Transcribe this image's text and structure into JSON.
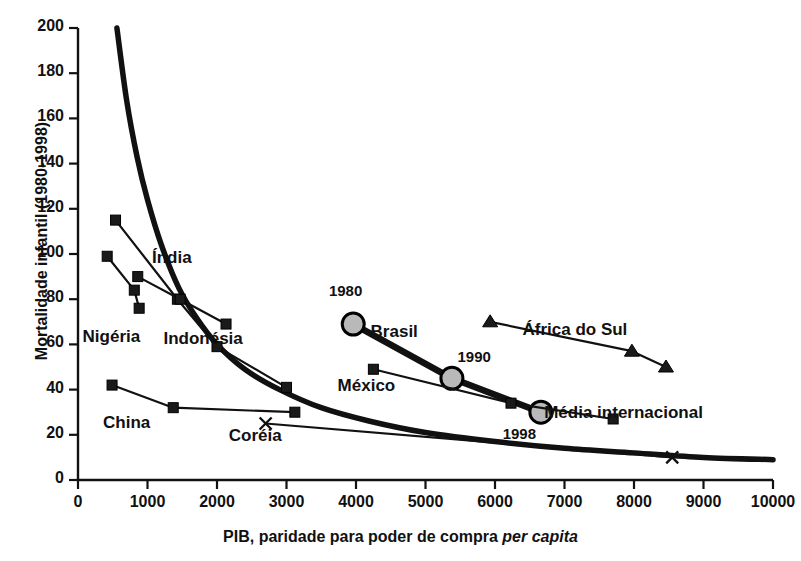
{
  "chart_data": {
    "type": "line",
    "title": "",
    "xlabel": "PIB, paridade para poder de compra per capita",
    "xlabel_plain": "PIB, paridade para poder de compra ",
    "xlabel_italic": "per capita",
    "ylabel": "Mortalidade infantil (1980-1998)",
    "xlim": [
      0,
      10000
    ],
    "ylim": [
      0,
      200
    ],
    "xticks": [
      0,
      1000,
      2000,
      3000,
      4000,
      5000,
      6000,
      7000,
      8000,
      9000,
      10000
    ],
    "yticks": [
      0,
      20,
      40,
      60,
      80,
      100,
      120,
      140,
      160,
      180,
      200
    ],
    "xtick_labels": [
      "0",
      "1000",
      "2000",
      "3000",
      "4000",
      "5000",
      "6000",
      "7000",
      "8000",
      "9000",
      "10000"
    ],
    "ytick_labels": [
      "0",
      "20",
      "40",
      "60",
      "80",
      "100",
      "120",
      "140",
      "160",
      "180",
      "200"
    ],
    "grid": false,
    "legend": "inline-annotations",
    "annotations": [
      {
        "id": "ann-1980",
        "text": "1980",
        "x": 3850,
        "y": 83
      },
      {
        "id": "ann-1990",
        "text": "1990",
        "x": 5700,
        "y": 54
      },
      {
        "id": "ann-1998",
        "text": "1998",
        "x": 6350,
        "y": 20
      }
    ],
    "series": [
      {
        "name": "Média internacional",
        "marker": "none",
        "style": "thick-fitted-curve",
        "label_x": 7850,
        "label_y": 29,
        "points": [
          {
            "x": 560,
            "y": 200
          },
          {
            "x": 700,
            "y": 168
          },
          {
            "x": 850,
            "y": 143
          },
          {
            "x": 1000,
            "y": 124
          },
          {
            "x": 1200,
            "y": 104
          },
          {
            "x": 1450,
            "y": 85
          },
          {
            "x": 1700,
            "y": 72
          },
          {
            "x": 2000,
            "y": 60
          },
          {
            "x": 2400,
            "y": 49
          },
          {
            "x": 2900,
            "y": 40
          },
          {
            "x": 3500,
            "y": 32
          },
          {
            "x": 4200,
            "y": 26
          },
          {
            "x": 5000,
            "y": 21
          },
          {
            "x": 6000,
            "y": 17
          },
          {
            "x": 7000,
            "y": 14
          },
          {
            "x": 8000,
            "y": 12
          },
          {
            "x": 9000,
            "y": 10
          },
          {
            "x": 10000,
            "y": 9
          }
        ]
      },
      {
        "name": "Índia",
        "marker": "square",
        "style": "thin",
        "label_x": 1350,
        "label_y": 98,
        "points": [
          {
            "x": 540,
            "y": 115
          },
          {
            "x": 1430,
            "y": 80
          },
          {
            "x": 2000,
            "y": 59
          },
          {
            "x": 3000,
            "y": 41
          }
        ]
      },
      {
        "name": "Nigéria",
        "marker": "square",
        "style": "thin",
        "label_x": 480,
        "label_y": 63,
        "points": [
          {
            "x": 420,
            "y": 99
          },
          {
            "x": 810,
            "y": 84
          },
          {
            "x": 880,
            "y": 76
          }
        ]
      },
      {
        "name": "Indonésia",
        "marker": "square",
        "style": "thin",
        "label_x": 1800,
        "label_y": 62,
        "points": [
          {
            "x": 860,
            "y": 90
          },
          {
            "x": 1470,
            "y": 80
          },
          {
            "x": 2130,
            "y": 69
          }
        ]
      },
      {
        "name": "China",
        "marker": "square",
        "style": "thin",
        "label_x": 700,
        "label_y": 25,
        "points": [
          {
            "x": 490,
            "y": 42
          },
          {
            "x": 1370,
            "y": 32
          },
          {
            "x": 3120,
            "y": 30
          }
        ]
      },
      {
        "name": "Coréia",
        "marker": "x",
        "style": "thin",
        "label_x": 2550,
        "label_y": 19,
        "points": [
          {
            "x": 2700,
            "y": 25
          },
          {
            "x": 8550,
            "y": 10
          }
        ]
      },
      {
        "name": "Brasil",
        "marker": "circle-shaded",
        "style": "very-thick",
        "label_x": 4550,
        "label_y": 65,
        "points": [
          {
            "x": 3960,
            "y": 69
          },
          {
            "x": 5380,
            "y": 45
          },
          {
            "x": 6660,
            "y": 30
          }
        ]
      },
      {
        "name": "México",
        "marker": "square",
        "style": "thin",
        "label_x": 4150,
        "label_y": 41,
        "points": [
          {
            "x": 4250,
            "y": 49
          },
          {
            "x": 6230,
            "y": 34
          },
          {
            "x": 7700,
            "y": 27
          }
        ]
      },
      {
        "name": "África do Sul",
        "marker": "triangle",
        "style": "thin",
        "label_x": 7150,
        "label_y": 66,
        "points": [
          {
            "x": 5930,
            "y": 70
          },
          {
            "x": 7970,
            "y": 57
          },
          {
            "x": 8460,
            "y": 50
          }
        ]
      }
    ]
  },
  "ghost_top_text": "••••  ••••••"
}
